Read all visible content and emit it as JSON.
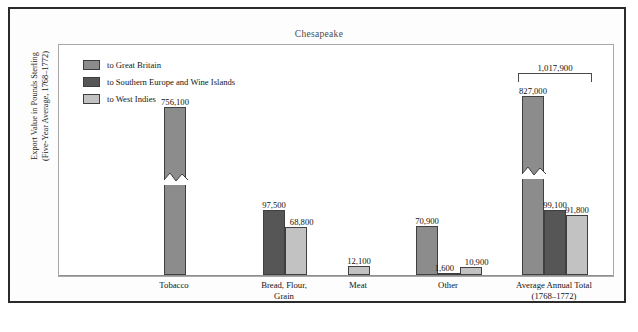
{
  "figure": {
    "title": "Chesapeake",
    "y_axis_label_line1": "Export Value in Pounds Sterling",
    "y_axis_label_line2": "(Five-Year Average, 1768–1772)",
    "bottom_caption": ""
  },
  "legend": {
    "items": [
      {
        "label": "to Great Britain",
        "color": "#8c8c8c"
      },
      {
        "label": "to Southern Europe and Wine Islands",
        "color": "#565656"
      },
      {
        "label": "to West Indies",
        "color": "#c2c2c2"
      }
    ]
  },
  "annotation": {
    "total_bracket_value": "1,017,900"
  },
  "chart_data": {
    "type": "bar",
    "title": "Chesapeake",
    "xlabel": "",
    "ylabel": "Export Value in Pounds Sterling (Five-Year Average, 1768–1772)",
    "grid": false,
    "legend_position": "top-left",
    "axis_note": "y-axis has no tick labels; tall bars use a zig-zag break symbol",
    "categories": [
      "Tobacco",
      "Bread, Flour, Grain",
      "Meat",
      "Other",
      "Average Annual Total (1768–1772)"
    ],
    "category_label_lines": [
      [
        "Tobacco"
      ],
      [
        "Bread, Flour,",
        "Grain"
      ],
      [
        "Meat"
      ],
      [
        "Other"
      ],
      [
        "Average Annual Total",
        "(1768–1772)"
      ]
    ],
    "series": [
      {
        "name": "to Great Britain",
        "color": "#8c8c8c",
        "values": [
          756100,
          null,
          null,
          70900,
          827000
        ],
        "value_labels": [
          "756,100",
          "",
          "",
          "70,900",
          "827,000"
        ]
      },
      {
        "name": "to Southern Europe and Wine Islands",
        "color": "#565656",
        "values": [
          null,
          97500,
          null,
          1600,
          99100
        ],
        "value_labels": [
          "",
          "97,500",
          "",
          "1,600",
          "99,100"
        ]
      },
      {
        "name": "to West Indies",
        "color": "#c2c2c2",
        "values": [
          null,
          68800,
          12100,
          10900,
          91800
        ],
        "value_labels": [
          "",
          "68,800",
          "12,100",
          "10,900",
          "91,800"
        ]
      }
    ],
    "annotations": [
      {
        "text": "1,017,900",
        "type": "bracket",
        "over_category": "Average Annual Total (1768–1772)"
      }
    ]
  },
  "bars": [
    {
      "cat": 0,
      "series": 0,
      "label": "756,100",
      "height_px": 168,
      "broken": true
    },
    {
      "cat": 1,
      "series": 1,
      "label": "97,500",
      "height_px": 65,
      "broken": false
    },
    {
      "cat": 1,
      "series": 2,
      "label": "68,800",
      "height_px": 48,
      "broken": false
    },
    {
      "cat": 2,
      "series": 2,
      "label": "12,100",
      "height_px": 9,
      "broken": false
    },
    {
      "cat": 3,
      "series": 0,
      "label": "70,900",
      "height_px": 49,
      "broken": false
    },
    {
      "cat": 3,
      "series": 1,
      "label": "1,600",
      "height_px": 2,
      "broken": false
    },
    {
      "cat": 3,
      "series": 2,
      "label": "10,900",
      "height_px": 8,
      "broken": false
    },
    {
      "cat": 4,
      "series": 0,
      "label": "827,000",
      "height_px": 179,
      "broken": true
    },
    {
      "cat": 4,
      "series": 1,
      "label": "99,100",
      "height_px": 65,
      "broken": false
    },
    {
      "cat": 4,
      "series": 2,
      "label": "91,800",
      "height_px": 60,
      "broken": false
    }
  ]
}
